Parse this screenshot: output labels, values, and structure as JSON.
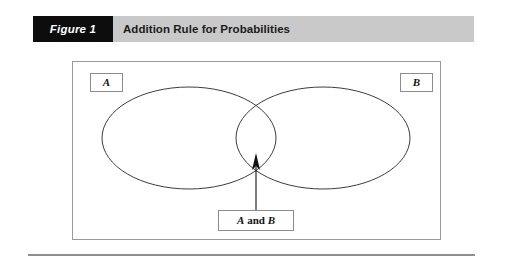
{
  "header": {
    "figure_number": "Figure 1",
    "title": "Addition Rule for Probabilities",
    "band_color": "#c9c9c9",
    "number_box_color": "#0d0d0d",
    "number_text_color": "#ffffff",
    "title_text_color": "#1b1b1b"
  },
  "diagram": {
    "type": "venn",
    "frame_border_color": "#9a9a9a",
    "background_color": "#ffffff",
    "curve_color": "#3d3d3d",
    "labels": {
      "set_a": "A",
      "set_b": "B",
      "intersection_italic_a": "A",
      "intersection_conjunction": "and",
      "intersection_italic_b": "B",
      "intersection_full": "A and B"
    },
    "sets": [
      {
        "name": "A",
        "shape": "ellipse",
        "cx": 189,
        "cy": 138,
        "rx": 87,
        "ry": 51
      },
      {
        "name": "B",
        "shape": "ellipse",
        "cx": 323,
        "cy": 138,
        "rx": 87,
        "ry": 51
      }
    ],
    "annotation": {
      "kind": "arrow",
      "points_to": "intersection",
      "from_x": 256,
      "from_y": 208,
      "to_x": 256,
      "to_y": 156,
      "color": "#111111"
    }
  },
  "footer": {
    "rule_color": "#8e8e94"
  }
}
